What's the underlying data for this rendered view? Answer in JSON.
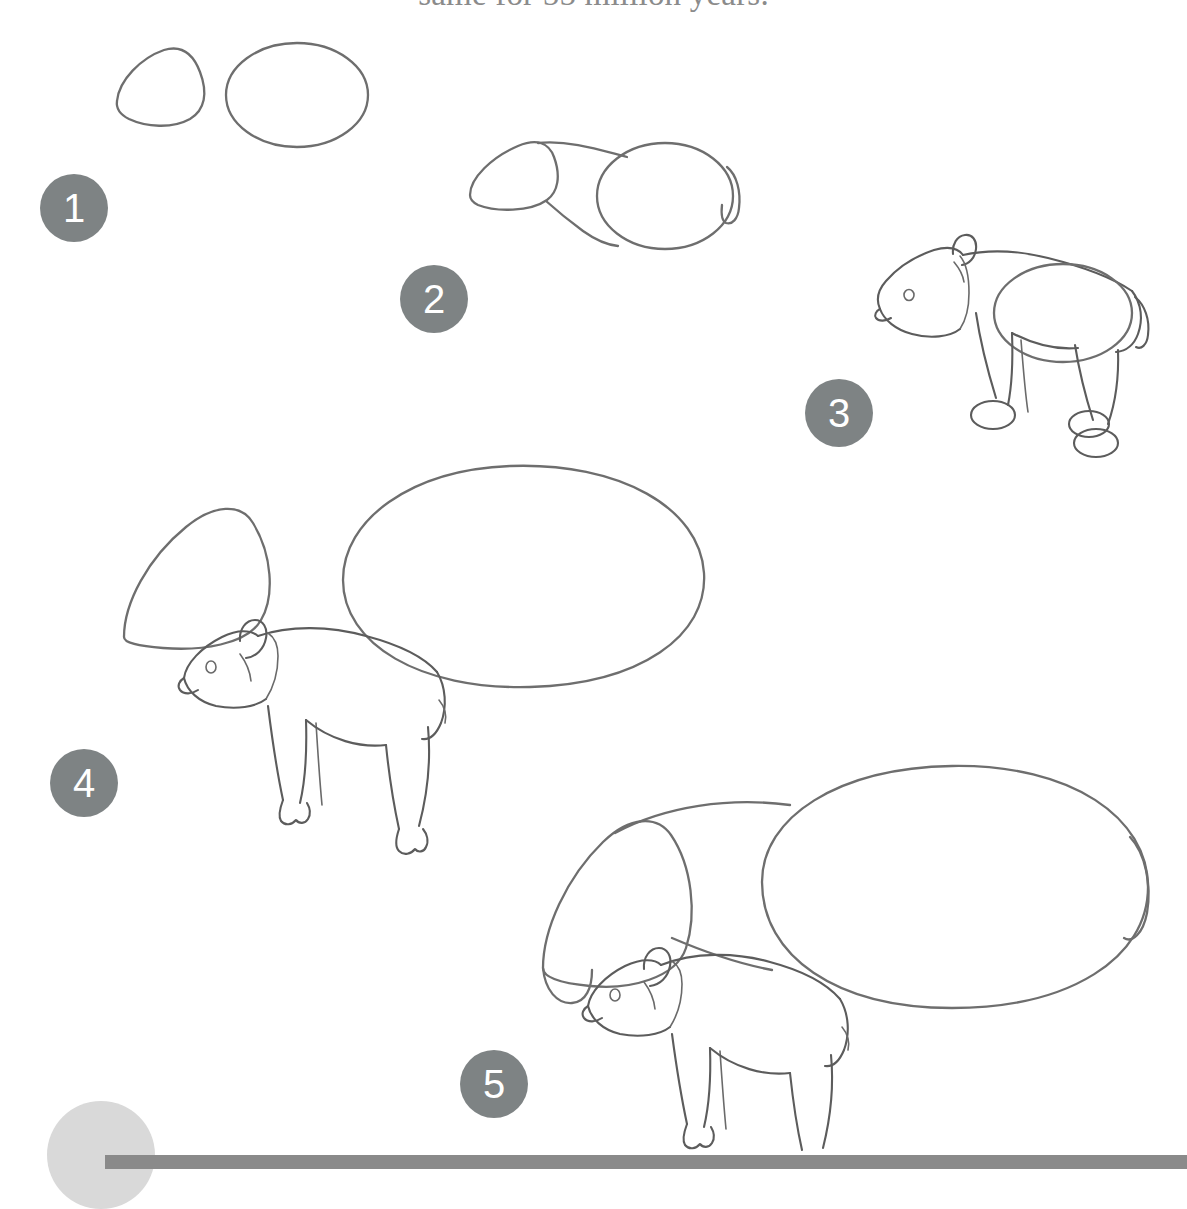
{
  "page": {
    "background_color": "#ffffff",
    "ink_color": "#5c5c5c",
    "badge_color": "#7e8384",
    "badge_text_color": "#ffffff",
    "footer_bar_color": "#8a8a8a",
    "footer_circle_color": "#d9d9d9"
  },
  "caption": {
    "text": "same for 55 million years.",
    "color": "#8b8b8b",
    "note": "clipped by the top edge of the page"
  },
  "steps": [
    {
      "number": "1",
      "label": "Step 1",
      "description": "Draw a rounded triangle for the head and a large oval for the body.",
      "shapes": [
        "head-triangle-guide",
        "body-oval-guide"
      ]
    },
    {
      "number": "2",
      "label": "Step 2",
      "description": "Connect the head and body with the neck and back line, and add a small tail.",
      "shapes": [
        "head-triangle-guide",
        "body-oval-guide",
        "neck-connector",
        "tail"
      ]
    },
    {
      "number": "3",
      "label": "Step 3",
      "description": "Refine the head with snout, eye and ear, then add four legs with oval feet.",
      "shapes": [
        "head",
        "ear",
        "eye",
        "snout",
        "body-oval-guide",
        "legs",
        "oval-feet",
        "tail"
      ]
    },
    {
      "number": "4",
      "label": "Step 4",
      "description": "Draw the finished tapir beside larger head and body guide shapes.",
      "shapes": [
        "head-triangle-guide-large",
        "body-oval-guide-large",
        "finished-tapir"
      ]
    },
    {
      "number": "5",
      "label": "Step 5",
      "description": "Complete the drawing with the full-size guide shapes and the finished tapir.",
      "shapes": [
        "head-triangle-guide-xl",
        "body-oval-guide-xl",
        "neck-connector",
        "tail",
        "finished-tapir"
      ]
    }
  ],
  "footer": {
    "bar_visible": true,
    "circle_visible": true
  }
}
